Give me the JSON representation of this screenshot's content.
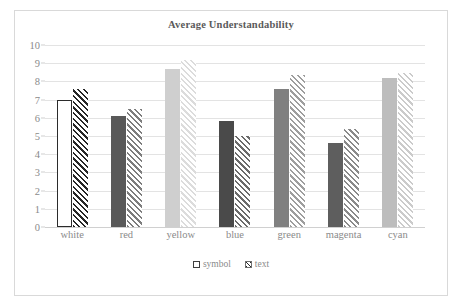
{
  "chart_data": {
    "type": "bar",
    "title": "Average Understandability",
    "xlabel": "",
    "ylabel": "",
    "ylim": [
      0,
      10
    ],
    "ytick_step": 1,
    "yticks": [
      "0",
      "1",
      "2",
      "3",
      "4",
      "5",
      "6",
      "7",
      "8",
      "9",
      "10"
    ],
    "grid": true,
    "legend_position": "bottom",
    "categories": [
      "white",
      "red",
      "yellow",
      "blue",
      "green",
      "magenta",
      "cyan"
    ],
    "series": [
      {
        "name": "symbol",
        "fill": "solid",
        "values": [
          7.0,
          6.1,
          8.7,
          5.8,
          7.6,
          4.6,
          8.2
        ],
        "colors": [
          "#ffffff",
          "#595959",
          "#cfcfcf",
          "#4a4a4a",
          "#808080",
          "#5e5e5e",
          "#bdbdbd"
        ],
        "border_colors": [
          "#2b2b2b",
          "#595959",
          "#cfcfcf",
          "#4a4a4a",
          "#808080",
          "#5e5e5e",
          "#bdbdbd"
        ]
      },
      {
        "name": "text",
        "fill": "diagonal-hatch",
        "values": [
          7.6,
          6.5,
          9.15,
          5.0,
          8.35,
          5.4,
          8.45
        ],
        "colors": [
          "#262626",
          "#7d7d7d",
          "#dcdcdc",
          "#6b6b6b",
          "#9e9e9e",
          "#8a8a8a",
          "#cbcbcb"
        ]
      }
    ]
  },
  "legend": {
    "items": [
      {
        "label": "symbol",
        "swatch": "open-square-swatch"
      },
      {
        "label": "text",
        "swatch": "hatched-square-swatch"
      }
    ]
  },
  "style": {
    "plot_background": "#ffffff",
    "frame_border": "#d9d9d9",
    "gridline_color": "#e3e3e3",
    "axis_text_color": "#8a8a8a",
    "title_color": "#5a5a5a"
  }
}
